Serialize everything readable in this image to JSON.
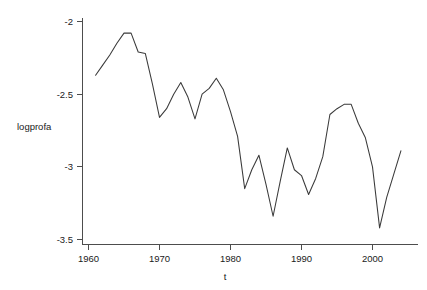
{
  "chart_data": {
    "type": "line",
    "title": "",
    "subtitle": "",
    "xlabel": "t",
    "ylabel": "logprofa",
    "xlim": [
      1959.2,
      2005.2
    ],
    "ylim": [
      -3.58,
      -1.93
    ],
    "grid": false,
    "legend": null,
    "x_ticks": [
      1960,
      1970,
      1980,
      1990,
      2000
    ],
    "x_tick_labels": [
      "1960",
      "1970",
      "1980",
      "1990",
      "2000"
    ],
    "y_ticks": [
      -2,
      -2.5,
      -3,
      -3.5
    ],
    "y_tick_labels": [
      "-2",
      "-2.5",
      "-3",
      "-3.5"
    ],
    "series": [
      {
        "name": "logprofa",
        "color": "#3a3a3a",
        "x": [
          1961,
          1962,
          1963,
          1964,
          1965,
          1966,
          1967,
          1968,
          1969,
          1970,
          1971,
          1972,
          1973,
          1974,
          1975,
          1976,
          1977,
          1978,
          1979,
          1980,
          1981,
          1982,
          1983,
          1984,
          1985,
          1986,
          1987,
          1988,
          1989,
          1990,
          1991,
          1992,
          1993,
          1994,
          1995,
          1996,
          1997,
          1998,
          1999,
          2000,
          2001,
          2002,
          2003,
          2004
        ],
        "values": [
          -2.37,
          -2.3,
          -2.23,
          -2.15,
          -2.08,
          -2.08,
          -2.21,
          -2.22,
          -2.43,
          -2.66,
          -2.6,
          -2.5,
          -2.42,
          -2.52,
          -2.67,
          -2.5,
          -2.46,
          -2.39,
          -2.47,
          -2.62,
          -2.79,
          -3.15,
          -3.02,
          -2.92,
          -3.12,
          -3.34,
          -3.1,
          -2.87,
          -3.02,
          -3.06,
          -3.19,
          -3.08,
          -2.93,
          -2.64,
          -2.6,
          -2.57,
          -2.57,
          -2.7,
          -2.8,
          -3.0,
          -3.42,
          -3.21,
          -3.05,
          -2.89
        ]
      }
    ]
  },
  "axes": {
    "y_axis_title": "logprofa",
    "x_axis_title": "t",
    "y_tick_labels": [
      "-2",
      "-2.5",
      "-3",
      "-3.5"
    ],
    "x_tick_labels": [
      "1960",
      "1970",
      "1980",
      "1990",
      "2000"
    ]
  }
}
